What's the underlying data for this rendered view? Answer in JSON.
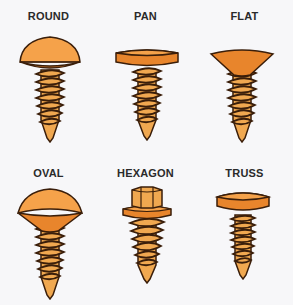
{
  "colors": {
    "head_light": "#f5a24a",
    "head_dark": "#e8852c",
    "thread_light": "#f0a850",
    "outline": "#3a1e0a",
    "background": "#f7f7f9"
  },
  "screws": [
    {
      "label": "ROUND",
      "head": "round"
    },
    {
      "label": "PAN",
      "head": "pan"
    },
    {
      "label": "FLAT",
      "head": "flat"
    },
    {
      "label": "OVAL",
      "head": "oval"
    },
    {
      "label": "HEXAGON",
      "head": "hexagon"
    },
    {
      "label": "TRUSS",
      "head": "truss"
    }
  ]
}
